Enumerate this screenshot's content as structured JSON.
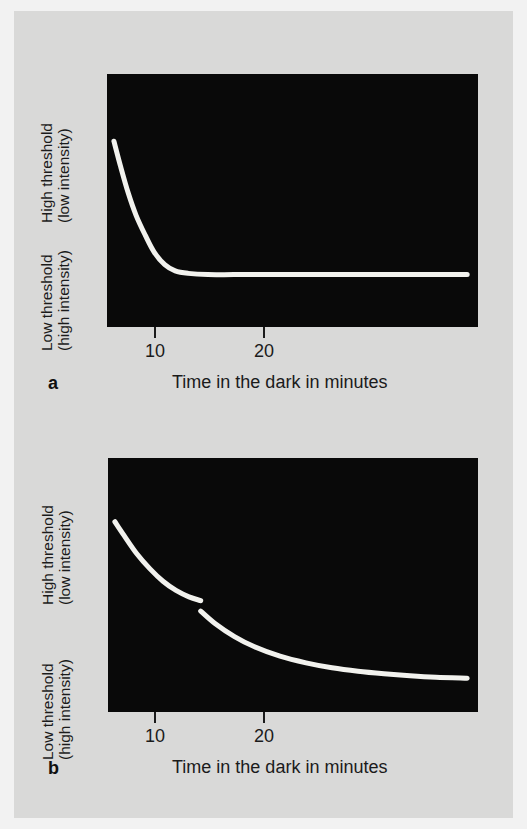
{
  "figure": {
    "background_color": "#d9d9d8",
    "plot_background_color": "#090909",
    "curve_color": "#f2f2ee",
    "text_color": "#1b1b1b"
  },
  "panels": [
    {
      "letter": "a",
      "y_axis": {
        "top_label_line1": "High threshold",
        "top_label_line2": "(low intensity)",
        "bottom_label_line1": "Low threshold",
        "bottom_label_line2": "(high intensity)"
      },
      "x_axis": {
        "caption": "Time in the dark in minutes",
        "ticks": [
          "10",
          "20"
        ]
      }
    },
    {
      "letter": "b",
      "y_axis": {
        "top_label_line1": "High threshold",
        "top_label_line2": "(low intensity)",
        "bottom_label_line1": "Low threshold",
        "bottom_label_line2": "(high intensity)"
      },
      "x_axis": {
        "caption": "Time in the dark in minutes",
        "ticks": [
          "10",
          "20"
        ]
      }
    }
  ],
  "chart_data": [
    {
      "type": "line",
      "panel": "a",
      "title": "",
      "xlabel": "Time in the dark in minutes",
      "ylabel": "Threshold (High threshold = low intensity; Low threshold = high intensity)",
      "xlim": [
        0,
        28
      ],
      "ylim": [
        0,
        1
      ],
      "xticks": [
        10,
        20
      ],
      "xticklabels": [
        "10",
        "20"
      ],
      "yticks": [],
      "grid": false,
      "legend": "none",
      "annotation": "Cone-only dark adaptation curve: threshold drops quickly then plateaus with no rod-cone break.",
      "series": [
        {
          "name": "cone adaptation",
          "x": [
            0.3,
            0.8,
            1.4,
            2.0,
            2.7,
            3.4,
            4.2,
            5.0,
            6.0,
            7.5,
            9.5,
            12.0,
            15.0,
            18.0,
            21.0,
            24.0,
            27.4
          ],
          "y": [
            0.74,
            0.64,
            0.53,
            0.44,
            0.36,
            0.29,
            0.24,
            0.215,
            0.205,
            0.2,
            0.2,
            0.2,
            0.2,
            0.2,
            0.2,
            0.2,
            0.2
          ]
        }
      ]
    },
    {
      "type": "line",
      "panel": "b",
      "title": "",
      "xlabel": "Time in the dark in minutes",
      "ylabel": "Threshold (High threshold = low intensity; Low threshold = high intensity)",
      "xlim": [
        0,
        28
      ],
      "ylim": [
        0,
        1
      ],
      "xticks": [
        10,
        20
      ],
      "xticklabels": [
        "10",
        "20"
      ],
      "yticks": [],
      "grid": false,
      "legend": "none",
      "annotation": "Rod and cone dark adaptation curve with a rod-cone break at about 7 minutes.",
      "series": [
        {
          "name": "cone branch",
          "x": [
            0.3,
            1.0,
            2.0,
            3.0,
            4.0,
            5.0,
            6.0,
            6.9
          ],
          "y": [
            0.755,
            0.7,
            0.625,
            0.565,
            0.515,
            0.478,
            0.452,
            0.437
          ]
        },
        {
          "name": "rod branch",
          "x": [
            6.9,
            8.0,
            9.5,
            11.0,
            13.0,
            15.0,
            17.0,
            19.0,
            21.0,
            23.0,
            25.0,
            27.4
          ],
          "y": [
            0.395,
            0.345,
            0.292,
            0.252,
            0.213,
            0.186,
            0.166,
            0.152,
            0.142,
            0.134,
            0.128,
            0.124
          ]
        }
      ],
      "break_point": {
        "x": 6.9,
        "label": "rod-cone break"
      }
    }
  ]
}
